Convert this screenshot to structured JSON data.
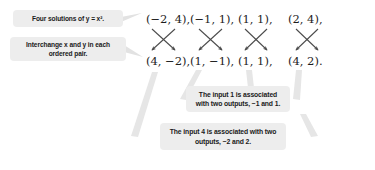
{
  "figure": {
    "type": "ordered-pair-mapping-diagram",
    "background_color": "#ffffff",
    "box_color": "#ededed",
    "text_color": "#1a1a1a",
    "leader_line_color": "#e0e0e0",
    "arrow_color": "#4a4a4a"
  },
  "labels": {
    "solutions": "Four solutions of y = x².",
    "interchange": "Interchange x and y in each ordered pair."
  },
  "notes": {
    "input1": "The input 1 is associated with two outputs, −1 and 1.",
    "input4": "The input 4 is associated with two outputs, −2 and 2."
  },
  "columns": [
    {
      "top": "(−2, 4),",
      "bottom": "(4, −2),",
      "swap": "crossing-arrows"
    },
    {
      "top": "(−1, 1),",
      "bottom": "(1, −1),",
      "swap": "crossing-arrows"
    },
    {
      "top": "(1, 1),",
      "bottom": "(1, 1),",
      "swap": "crossing-arrows"
    },
    {
      "top": "(2, 4),",
      "bottom": "(4, 2).",
      "swap": "crossing-arrows"
    }
  ]
}
